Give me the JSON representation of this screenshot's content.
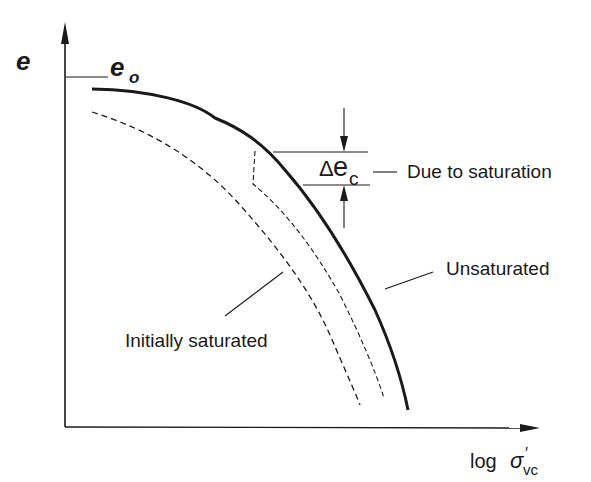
{
  "diagram": {
    "axes": {
      "y_label": "e",
      "x_label_prefix": "log",
      "x_label_symbol": "σ",
      "x_label_prime": "′",
      "x_label_subscript": "vc"
    },
    "annotations": {
      "e0_main": "e",
      "e0_sub": "o",
      "delta_symbol": "Δ",
      "delta_e": "e",
      "delta_sub": "c",
      "due_to_saturation": "Due to saturation"
    },
    "curves": [
      {
        "name": "Unsaturated",
        "style": "solid-thick"
      },
      {
        "name": "Initially saturated",
        "style": "dashed"
      },
      {
        "name": "after saturation (collapse)",
        "style": "dashed-thin"
      }
    ],
    "labels": {
      "unsaturated": "Unsaturated",
      "initially_saturated": "Initially saturated"
    },
    "colors": {
      "ink": "#1a1a1a",
      "background": "#ffffff"
    }
  }
}
